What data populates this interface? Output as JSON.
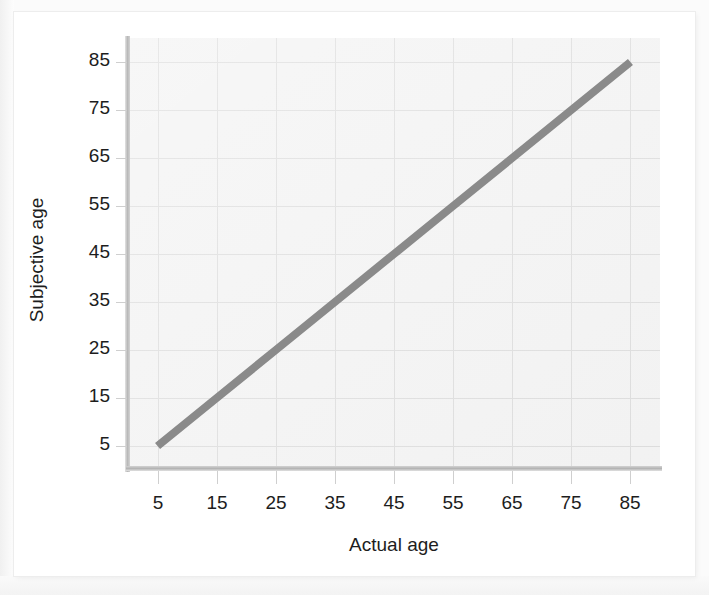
{
  "chart_data": {
    "type": "line",
    "title": "",
    "subtitle": "",
    "xlabel": "Actual age",
    "ylabel": "Subjective age",
    "xlim": [
      0,
      90
    ],
    "ylim": [
      0,
      90
    ],
    "xticks": [
      5,
      15,
      25,
      35,
      45,
      55,
      65,
      75,
      85
    ],
    "yticks": [
      5,
      15,
      25,
      35,
      45,
      55,
      65,
      75,
      85
    ],
    "xtick_labels": [
      "5",
      "15",
      "25",
      "35",
      "45",
      "55",
      "65",
      "75",
      "85"
    ],
    "ytick_labels": [
      "5",
      "15",
      "25",
      "35",
      "45",
      "55",
      "65",
      "75",
      "85"
    ],
    "grid": true,
    "legend": null,
    "annotations": [],
    "series": [
      {
        "name": "Identity line (subjective age = actual age)",
        "x": [
          5,
          15,
          25,
          35,
          45,
          55,
          65,
          75,
          85
        ],
        "values": [
          5,
          15,
          25,
          35,
          45,
          55,
          65,
          75,
          85
        ],
        "color": "#8a8a8a",
        "line_width_px": 8,
        "style": "solid",
        "markers": false
      }
    ]
  },
  "axes": {
    "x_title": "Actual age",
    "y_title": "Subjective age"
  },
  "colors": {
    "page_background": "#fbfbfb",
    "card_background": "#ffffff",
    "plot_background": "#f2f2f2",
    "gridline": "#dadada",
    "axis_spine": "#b9b9b9",
    "tick_mark": "#cfcfcf",
    "tick_label_text": "#1d1d1d",
    "series_line": "#8a8a8a"
  }
}
